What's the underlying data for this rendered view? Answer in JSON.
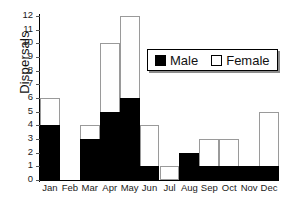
{
  "chart_data": {
    "type": "bar",
    "title": "",
    "xlabel": "",
    "ylabel": "Dispersals",
    "stacked": true,
    "grid": false,
    "legend_position": "upper-right-inside",
    "categories": [
      "Jan",
      "Feb",
      "Mar",
      "Apr",
      "May",
      "Jun",
      "Jul",
      "Aug",
      "Sep",
      "Oct",
      "Nov",
      "Dec"
    ],
    "ylim": [
      0,
      12
    ],
    "ytick_labels": [
      "0",
      "1",
      "2",
      "3",
      "4",
      "5",
      "6",
      "7",
      "8",
      "9",
      "10",
      "11",
      "12"
    ],
    "series": [
      {
        "name": "Male",
        "color": "#000000",
        "values": [
          4,
          0,
          3,
          5,
          6,
          1,
          0,
          2,
          1,
          1,
          1,
          1
        ]
      },
      {
        "name": "Female",
        "color": "#ffffff",
        "values": [
          2,
          0,
          1,
          5,
          6,
          3,
          1,
          0,
          2,
          2,
          0,
          4
        ]
      }
    ],
    "totals": [
      6,
      0,
      4,
      10,
      12,
      4,
      1,
      2,
      3,
      3,
      1,
      5
    ]
  },
  "legend": {
    "items": [
      {
        "label": "Male",
        "swatch": "filled-black-square"
      },
      {
        "label": "Female",
        "swatch": "outlined-white-square"
      }
    ]
  }
}
